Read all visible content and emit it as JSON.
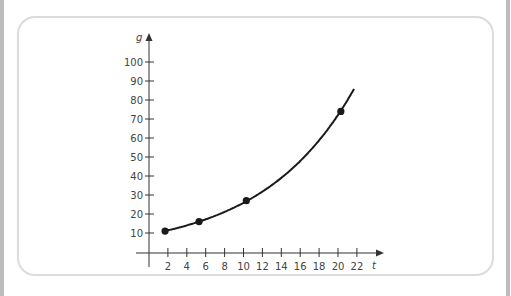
{
  "chart_data": {
    "type": "line",
    "title": "",
    "xlabel": "t",
    "ylabel": "g",
    "x_ticks": [
      2,
      4,
      6,
      8,
      10,
      12,
      14,
      16,
      18,
      20,
      22
    ],
    "y_ticks": [
      10,
      20,
      30,
      40,
      50,
      60,
      70,
      80,
      90,
      100
    ],
    "xlim": [
      0,
      23
    ],
    "ylim": [
      0,
      105
    ],
    "grid": false,
    "legend": null,
    "series": [
      {
        "name": "g(t)",
        "curve": "exponential",
        "x": [
          1.7,
          5.3,
          10.3,
          20.3
        ],
        "values": [
          11,
          16,
          27,
          74
        ],
        "curve_end": {
          "x": 21.7,
          "y": 95
        }
      }
    ]
  },
  "labels": {
    "x_axis": "t",
    "y_axis": "g",
    "x_tick_labels": [
      "2",
      "4",
      "6",
      "8",
      "10",
      "12",
      "14",
      "16",
      "18",
      "20",
      "22"
    ],
    "y_tick_labels": [
      "10",
      "20",
      "30",
      "40",
      "50",
      "60",
      "70",
      "80",
      "90",
      "100"
    ]
  }
}
